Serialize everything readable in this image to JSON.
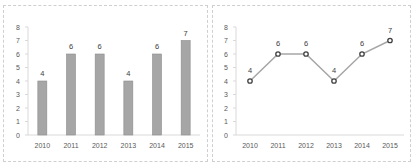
{
  "chart_data": [
    {
      "type": "bar",
      "title": "",
      "categories": [
        "2010",
        "2011",
        "2012",
        "2013",
        "2014",
        "2015"
      ],
      "values": [
        4,
        6,
        6,
        4,
        6,
        7
      ],
      "data_labels": [
        "4",
        "6",
        "6",
        "4",
        "6",
        "7"
      ],
      "xlabel": "",
      "ylabel": "",
      "ylim": [
        0,
        8
      ],
      "yticks": [
        "0",
        "1",
        "2",
        "3",
        "4",
        "5",
        "6",
        "7",
        "8"
      ],
      "grid": false,
      "legend": null,
      "bar_color": "#a6a6a6",
      "bar_border": "#8c8c8c"
    },
    {
      "type": "line",
      "title": "",
      "categories": [
        "2010",
        "2011",
        "2012",
        "2013",
        "2014",
        "2015"
      ],
      "values": [
        4,
        6,
        6,
        4,
        6,
        7
      ],
      "data_labels": [
        "4",
        "6",
        "6",
        "4",
        "6",
        "7"
      ],
      "xlabel": "",
      "ylabel": "",
      "ylim": [
        0,
        8
      ],
      "yticks": [
        "0",
        "1",
        "2",
        "3",
        "4",
        "5",
        "6",
        "7",
        "8"
      ],
      "grid": false,
      "legend": null,
      "line_color": "#a6a6a6",
      "marker_color": "#404040",
      "marker": "circle-open"
    }
  ]
}
